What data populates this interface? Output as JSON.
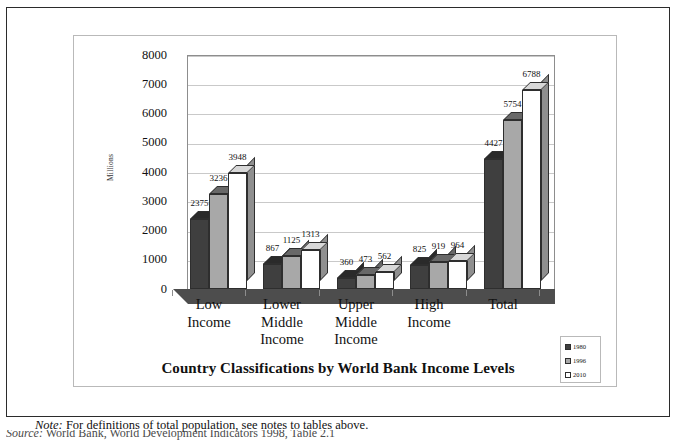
{
  "chart_data": {
    "type": "bar",
    "title": "Country Classifications by World Bank Income Levels",
    "xlabel": "",
    "ylabel": "Millions",
    "ylim": [
      0,
      8000
    ],
    "ytick_step": 1000,
    "yticks": [
      "8000",
      "7000",
      "6000",
      "5000",
      "4000",
      "3000",
      "2000",
      "1000",
      "0"
    ],
    "grid": true,
    "legend_position": "bottom-right",
    "categories": [
      [
        "Low",
        "Income"
      ],
      [
        "Lower",
        "Middle",
        "Income"
      ],
      [
        "Upper",
        "Middle",
        "Income"
      ],
      [
        "High",
        "Income"
      ],
      [
        "Total"
      ]
    ],
    "category_names": [
      "Low Income",
      "Lower Middle Income",
      "Upper Middle Income",
      "High Income",
      "Total"
    ],
    "series": [
      {
        "name": "1980",
        "color": "#3f3f3f",
        "values": [
          2375,
          867,
          360,
          825,
          4427
        ]
      },
      {
        "name": "1996",
        "color": "#a8a8a8",
        "values": [
          3236,
          1125,
          473,
          919,
          5754
        ]
      },
      {
        "name": "2010",
        "color": "#ffffff",
        "values": [
          3948,
          1313,
          562,
          964,
          6788
        ]
      }
    ]
  },
  "legend": {
    "items": [
      {
        "label": "1980"
      },
      {
        "label": "1996"
      },
      {
        "label": "2010"
      }
    ]
  },
  "note": {
    "word": "Note:",
    "text": "For definitions of total population, see notes to tables above."
  },
  "source": {
    "word": "Source:",
    "text": "World Bank, World Development Indicators 1998, Table 2.1"
  }
}
